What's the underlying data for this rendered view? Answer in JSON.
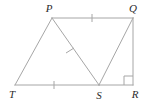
{
  "figure": {
    "kind": "geometry-diagram",
    "stroke_color": "#a6a6a6",
    "label_color": "#2b2b2b",
    "background_color": "#ffffff",
    "width": 152,
    "height": 104,
    "labels": {
      "p": "P",
      "q": "Q",
      "t": "T",
      "s": "S",
      "r": "R"
    },
    "points": {
      "P": {
        "x": 52,
        "y": 18
      },
      "Q": {
        "x": 133,
        "y": 18
      },
      "T": {
        "x": 15,
        "y": 85
      },
      "S": {
        "x": 99,
        "y": 85
      },
      "R": {
        "x": 133,
        "y": 85
      }
    },
    "label_positions": {
      "P": {
        "x": 49,
        "y": 12
      },
      "Q": {
        "x": 133,
        "y": 12
      },
      "T": {
        "x": 12,
        "y": 98
      },
      "S": {
        "x": 99,
        "y": 99
      },
      "R": {
        "x": 135,
        "y": 98
      }
    },
    "segments": [
      {
        "name": "segment-TP",
        "from": "T",
        "to": "P",
        "x1": 15,
        "y1": 85,
        "x2": 52,
        "y2": 18
      },
      {
        "name": "segment-PQ",
        "from": "P",
        "to": "Q",
        "x1": 52,
        "y1": 18,
        "x2": 133,
        "y2": 18
      },
      {
        "name": "segment-PS",
        "from": "P",
        "to": "S",
        "x1": 52,
        "y1": 18,
        "x2": 99,
        "y2": 85
      },
      {
        "name": "segment-SQ",
        "from": "S",
        "to": "Q",
        "x1": 99,
        "y1": 85,
        "x2": 133,
        "y2": 18
      },
      {
        "name": "segment-TS",
        "from": "T",
        "to": "S",
        "x1": 15,
        "y1": 85,
        "x2": 99,
        "y2": 85
      },
      {
        "name": "segment-SR",
        "from": "S",
        "to": "R",
        "x1": 99,
        "y1": 85,
        "x2": 133,
        "y2": 85
      },
      {
        "name": "segment-QR",
        "from": "Q",
        "to": "R",
        "x1": 133,
        "y1": 18,
        "x2": 133,
        "y2": 85
      }
    ],
    "tick_marks": [
      {
        "name": "tick-mark-pq",
        "on_segment": "segment-PQ",
        "x1": 92,
        "y1": 14,
        "x2": 92,
        "y2": 22
      },
      {
        "name": "tick-mark-ps",
        "on_segment": "segment-PS",
        "x1": 66,
        "y1": 53,
        "x2": 74,
        "y2": 48
      },
      {
        "name": "tick-mark-ts",
        "on_segment": "segment-TS",
        "x1": 54,
        "y1": 81,
        "x2": 54,
        "y2": 89
      }
    ],
    "right_angle": {
      "name": "right-angle-marker-r",
      "at_vertex": "R",
      "path": "M 124 85 L 124 76 L 133 76"
    }
  }
}
